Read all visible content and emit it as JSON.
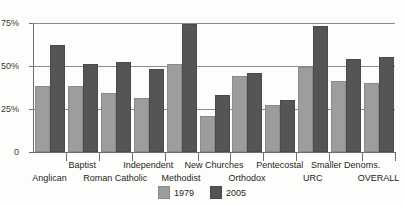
{
  "chart_data": {
    "type": "bar",
    "title": "",
    "xlabel": "",
    "ylabel": "",
    "ylim": [
      0,
      75
    ],
    "grid": true,
    "legend_position": "bottom-center",
    "ytick_labels": [
      "75%",
      "50%",
      "25%",
      "0"
    ],
    "ytick_values": [
      75,
      50,
      25,
      0
    ],
    "categories": [
      "Anglican",
      "Baptist",
      "Roman Catholic",
      "Independent",
      "Methodist",
      "New Churches",
      "Orthodox",
      "Pentecostal",
      "URC",
      "Smaller Denoms.",
      "OVERALL"
    ],
    "series": [
      {
        "name": "1979",
        "color": "#9d9d9d",
        "values": [
          37,
          37,
          33,
          30,
          50,
          20,
          43,
          26,
          48,
          40,
          39
        ]
      },
      {
        "name": "2005",
        "color": "#555555",
        "values": [
          61,
          50,
          51,
          47,
          73,
          32,
          45,
          29,
          72,
          53,
          54
        ]
      }
    ]
  },
  "legend": {
    "items": [
      {
        "label": "1979"
      },
      {
        "label": "2005"
      }
    ]
  }
}
